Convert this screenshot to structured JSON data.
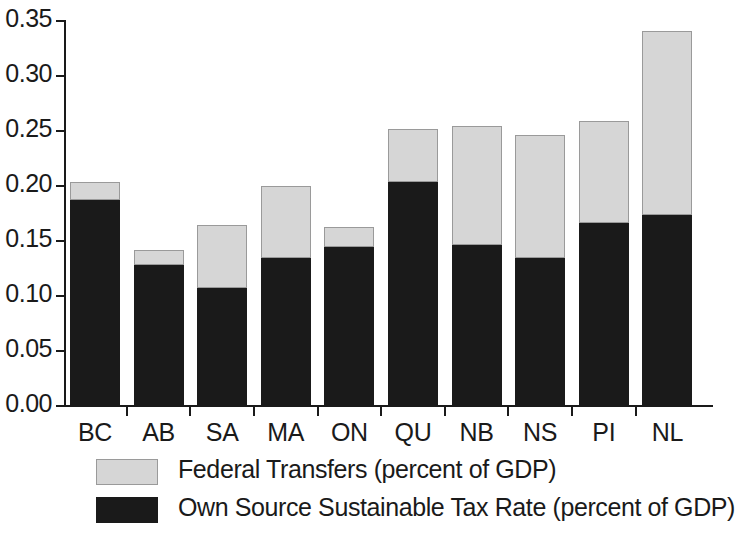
{
  "chart_data": {
    "type": "bar",
    "stacked": true,
    "title": "",
    "subtitle": "",
    "xlabel": "",
    "ylabel": "",
    "ylim": [
      0.0,
      0.35
    ],
    "ytick_labels": [
      "0.35",
      "0.30",
      "0.25",
      "0.20",
      "0.15",
      "0.10",
      "0.05",
      "0.00"
    ],
    "ytick_values": [
      0.35,
      0.3,
      0.25,
      0.2,
      0.15,
      0.1,
      0.05,
      0.0
    ],
    "grid": false,
    "legend_position": "bottom-left",
    "categories": [
      "BC",
      "AB",
      "SA",
      "MA",
      "ON",
      "QU",
      "NB",
      "NS",
      "PI",
      "NL"
    ],
    "series": [
      {
        "name": "Own Source Sustainable Tax Rate (percent of GDP)",
        "color": "#1a1a1a",
        "values": [
          0.187,
          0.128,
          0.107,
          0.135,
          0.145,
          0.204,
          0.146,
          0.135,
          0.166,
          0.174
        ]
      },
      {
        "name": "Federal Transfers (percent of GDP)",
        "color": "#d6d6d6",
        "values": [
          0.017,
          0.014,
          0.058,
          0.065,
          0.018,
          0.048,
          0.109,
          0.111,
          0.093,
          0.167
        ]
      }
    ],
    "totals": [
      0.204,
      0.142,
      0.165,
      0.2,
      0.163,
      0.252,
      0.255,
      0.246,
      0.259,
      0.341
    ]
  },
  "legend": {
    "items": [
      {
        "label": "Federal Transfers (percent of GDP)",
        "swatch": "federal",
        "color": "#d6d6d6"
      },
      {
        "label": "Own Source Sustainable Tax Rate (percent of GDP)",
        "swatch": "own",
        "color": "#1a1a1a"
      }
    ]
  }
}
